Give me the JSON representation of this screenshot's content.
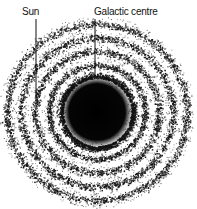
{
  "diagram": {
    "labels": {
      "sun": "Sun",
      "galactic_centre": "Galactic centre"
    },
    "colors": {
      "stars": "#111111",
      "background": "#ffffff"
    },
    "center": {
      "x": 97,
      "y": 112
    },
    "core_radius": 34,
    "rings": [
      {
        "radius": 48,
        "width": 5
      },
      {
        "radius": 62,
        "width": 6
      },
      {
        "radius": 76,
        "width": 6
      },
      {
        "radius": 90,
        "width": 6
      }
    ],
    "pointers": {
      "sun": {
        "x": 36,
        "y1": 19,
        "y2": 110
      },
      "galactic_centre": {
        "x": 95,
        "y1": 19,
        "y2": 78
      }
    }
  }
}
